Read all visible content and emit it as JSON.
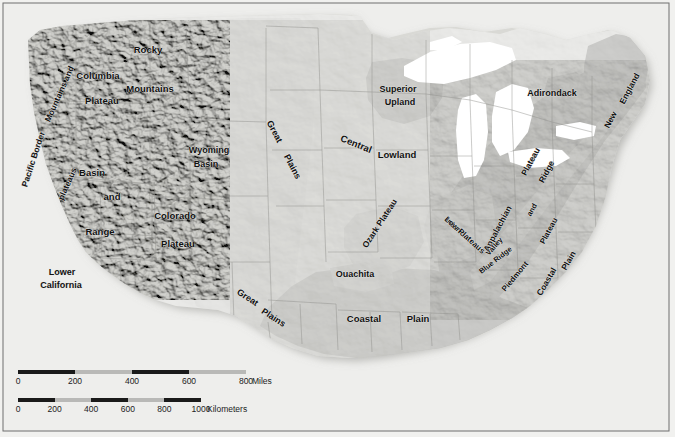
{
  "map": {
    "title": "Physiographic Provinces of the United States",
    "background_color": "#eeeeec",
    "frame_color": "#6f6f6f",
    "water_color": "#ffffff",
    "land_light_color": "#d8d8d4",
    "land_mid_color": "#c3c3bf",
    "land_dark_color": "#9a9a96",
    "labels": [
      {
        "id": "pacific-border",
        "text": "Pacific Border",
        "x": 36,
        "y": 160,
        "size": 8.5,
        "rotate": -72
      },
      {
        "id": "mountains-and",
        "text": "Mountains  and",
        "x": 62,
        "y": 95,
        "size": 8.5,
        "rotate": -66
      },
      {
        "id": "plateaus",
        "text": "plateaus",
        "x": 70,
        "y": 185,
        "size": 8.5,
        "rotate": -66
      },
      {
        "id": "columbia-plateau",
        "text": "Columbia",
        "x": 98,
        "y": 79,
        "size": 9.5,
        "rotate": 0
      },
      {
        "id": "columbia-plateau-2",
        "text": "Plateau",
        "x": 102,
        "y": 104,
        "size": 9.5,
        "rotate": 0
      },
      {
        "id": "rocky-mountains",
        "text": "Rocky",
        "x": 148,
        "y": 53,
        "size": 9.5,
        "rotate": 0
      },
      {
        "id": "rocky-mountains-2",
        "text": "Mountains",
        "x": 150,
        "y": 92,
        "size": 9.5,
        "rotate": 0
      },
      {
        "id": "wyoming-basin",
        "text": "Wyoming",
        "x": 209,
        "y": 153,
        "size": 9.0,
        "rotate": 0
      },
      {
        "id": "wyoming-basin-2",
        "text": "Basin",
        "x": 206,
        "y": 167,
        "size": 9.0,
        "rotate": 0
      },
      {
        "id": "basin",
        "text": "Basin",
        "x": 92,
        "y": 176,
        "size": 9.5,
        "rotate": 0
      },
      {
        "id": "and",
        "text": "and",
        "x": 112,
        "y": 200,
        "size": 9.5,
        "rotate": 0
      },
      {
        "id": "range",
        "text": "Range",
        "x": 100,
        "y": 235,
        "size": 9.5,
        "rotate": 0
      },
      {
        "id": "colorado-plateau",
        "text": "Colorado",
        "x": 175,
        "y": 219,
        "size": 9.5,
        "rotate": 0
      },
      {
        "id": "colorado-plateau-2",
        "text": "Plateau",
        "x": 178,
        "y": 247,
        "size": 9.5,
        "rotate": 0
      },
      {
        "id": "lower-california",
        "text": "Lower",
        "x": 62,
        "y": 275,
        "size": 9.0,
        "rotate": 0
      },
      {
        "id": "lower-california-2",
        "text": "California",
        "x": 61,
        "y": 288,
        "size": 9.0,
        "rotate": 0
      },
      {
        "id": "great-plains-n",
        "text": "Great",
        "x": 272,
        "y": 133,
        "size": 9.0,
        "rotate": 62
      },
      {
        "id": "great-plains-n2",
        "text": "Plains",
        "x": 290,
        "y": 168,
        "size": 9.0,
        "rotate": 62
      },
      {
        "id": "great-plains-s",
        "text": "Great",
        "x": 246,
        "y": 300,
        "size": 9.0,
        "rotate": 33
      },
      {
        "id": "great-plains-s2",
        "text": "Plains",
        "x": 272,
        "y": 320,
        "size": 9.0,
        "rotate": 33
      },
      {
        "id": "central-lowland",
        "text": "Central",
        "x": 355,
        "y": 147,
        "size": 9.5,
        "rotate": 22
      },
      {
        "id": "central-lowland-2",
        "text": "Lowland",
        "x": 397,
        "y": 158,
        "size": 9.5,
        "rotate": 0
      },
      {
        "id": "superior-upland",
        "text": "Superior",
        "x": 398,
        "y": 92,
        "size": 9.0,
        "rotate": 0
      },
      {
        "id": "superior-upland-2",
        "text": "Upland",
        "x": 400,
        "y": 105,
        "size": 9.0,
        "rotate": 0
      },
      {
        "id": "ozark-plateau",
        "text": "Ozark Plateau",
        "x": 382,
        "y": 225,
        "size": 8.5,
        "rotate": -57
      },
      {
        "id": "ouachita",
        "text": "Ouachita",
        "x": 355,
        "y": 277,
        "size": 9.0,
        "rotate": 0
      },
      {
        "id": "coastal-plain-s",
        "text": "Coastal",
        "x": 364,
        "y": 322,
        "size": 9.5,
        "rotate": 0
      },
      {
        "id": "coastal-plain-s2",
        "text": "Plain",
        "x": 418,
        "y": 322,
        "size": 9.5,
        "rotate": 0
      },
      {
        "id": "interior-low",
        "text": "Interior",
        "x": 455,
        "y": 230,
        "size": 8.0,
        "rotate": 42
      },
      {
        "id": "interior-low-2",
        "text": "Low Plateaus",
        "x": 463,
        "y": 237,
        "size": 8.0,
        "rotate": 42
      },
      {
        "id": "appalachian-plateau",
        "text": "Appalachian",
        "x": 500,
        "y": 230,
        "size": 8.5,
        "rotate": -62
      },
      {
        "id": "appalachian-plateau-2",
        "text": "Plateau",
        "x": 533,
        "y": 163,
        "size": 8.5,
        "rotate": -62
      },
      {
        "id": "valley",
        "text": "Valley",
        "x": 496,
        "y": 248,
        "size": 7.5,
        "rotate": -48
      },
      {
        "id": "and-2",
        "text": "and",
        "x": 534,
        "y": 211,
        "size": 7.5,
        "rotate": -60
      },
      {
        "id": "ridge",
        "text": "Ridge",
        "x": 549,
        "y": 173,
        "size": 8.5,
        "rotate": -62
      },
      {
        "id": "blue-ridge",
        "text": "Blue Ridge",
        "x": 497,
        "y": 262,
        "size": 7.5,
        "rotate": -38
      },
      {
        "id": "piedmont",
        "text": "Piedmont",
        "x": 517,
        "y": 278,
        "size": 8.0,
        "rotate": -50
      },
      {
        "id": "piedmont-plateau",
        "text": "Plateau",
        "x": 551,
        "y": 232,
        "size": 8.0,
        "rotate": -62
      },
      {
        "id": "coastal-plain-e",
        "text": "Coastal",
        "x": 549,
        "y": 283,
        "size": 8.5,
        "rotate": -60
      },
      {
        "id": "coastal-plain-e2",
        "text": "Plain",
        "x": 571,
        "y": 262,
        "size": 8.5,
        "rotate": -60
      },
      {
        "id": "adirondack",
        "text": "Adirondack",
        "x": 552,
        "y": 96,
        "size": 9.0,
        "rotate": 0
      },
      {
        "id": "new-england",
        "text": "New",
        "x": 613,
        "y": 121,
        "size": 8.5,
        "rotate": -62
      },
      {
        "id": "new-england-2",
        "text": "England",
        "x": 632,
        "y": 90,
        "size": 8.5,
        "rotate": -62
      }
    ]
  },
  "scale_miles": {
    "id": "scale-bar-miles",
    "unit_label": "Miles",
    "ticks": [
      "0",
      "200",
      "400",
      "600",
      "800"
    ],
    "max": 800,
    "pixel_length": 228,
    "segments": [
      {
        "from": 0,
        "to": 200,
        "shade": "dark"
      },
      {
        "from": 200,
        "to": 400,
        "shade": "light"
      },
      {
        "from": 400,
        "to": 600,
        "shade": "dark"
      },
      {
        "from": 600,
        "to": 800,
        "shade": "light"
      }
    ]
  },
  "scale_km": {
    "id": "scale-bar-kilometers",
    "unit_label": "Kilometers",
    "ticks": [
      "0",
      "200",
      "400",
      "600",
      "800",
      "1000"
    ],
    "max": 1000,
    "pixel_length": 183,
    "segments": [
      {
        "from": 0,
        "to": 200,
        "shade": "dark"
      },
      {
        "from": 200,
        "to": 400,
        "shade": "light"
      },
      {
        "from": 400,
        "to": 600,
        "shade": "dark"
      },
      {
        "from": 600,
        "to": 800,
        "shade": "light"
      },
      {
        "from": 800,
        "to": 1000,
        "shade": "dark"
      }
    ]
  }
}
